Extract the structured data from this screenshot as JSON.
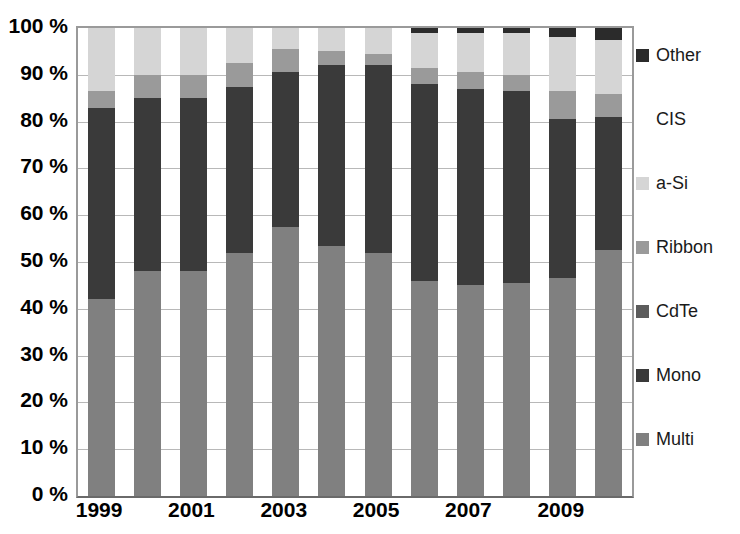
{
  "chart_data": {
    "type": "bar",
    "subtype": "stacked-percentage",
    "title": "",
    "subtitle": "",
    "xlabel": "",
    "ylabel": "",
    "ylim": [
      0,
      100
    ],
    "yunit": "%",
    "grid": true,
    "legend_position": "right",
    "categories": [
      "1999",
      "2000",
      "2001",
      "2002",
      "2003",
      "2004",
      "2005",
      "2006",
      "2007",
      "2008",
      "2009",
      "2010"
    ],
    "x_tick_labels": [
      "1999",
      "",
      "2001",
      "",
      "2003",
      "",
      "2005",
      "",
      "2007",
      "",
      "2009",
      ""
    ],
    "y_tick_labels": [
      "0 %",
      "10 %",
      "20 %",
      "30 %",
      "40 %",
      "50 %",
      "60 %",
      "70 %",
      "80 %",
      "90 %",
      "100 %"
    ],
    "y_tick_values": [
      0,
      10,
      20,
      30,
      40,
      50,
      60,
      70,
      80,
      90,
      100
    ],
    "series": [
      {
        "name": "Multi",
        "color": "#808080",
        "values": [
          42,
          48,
          48,
          52,
          57.5,
          53.5,
          52,
          46,
          45,
          45.5,
          46.5,
          52.5
        ]
      },
      {
        "name": "Mono",
        "color": "#3a3a3a",
        "values": [
          41,
          37,
          37,
          35.5,
          33,
          38.5,
          40,
          42,
          42,
          41,
          34,
          28.5
        ]
      },
      {
        "name": "CdTe",
        "color": "#5c5c5c",
        "values": [
          0,
          0,
          0,
          0,
          0,
          0,
          0,
          0,
          0,
          0,
          0,
          0
        ]
      },
      {
        "name": "Ribbon",
        "color": "#9a9a9a",
        "values": [
          3.5,
          5,
          5,
          5,
          5,
          3,
          2.5,
          3.5,
          3.5,
          3.5,
          6,
          5
        ]
      },
      {
        "name": "a-Si",
        "color": "#d5d5d5",
        "values": [
          13.5,
          10,
          10,
          7.5,
          4.5,
          5,
          5.5,
          7.5,
          8.5,
          9,
          11.5,
          11.5
        ]
      },
      {
        "name": "CIS",
        "color": "#ffffff",
        "values": [
          0,
          0,
          0,
          0,
          0,
          0,
          0,
          0,
          0,
          0,
          0,
          0
        ]
      },
      {
        "name": "Other",
        "color": "#2b2b2b",
        "values": [
          0,
          0,
          0,
          0,
          0,
          0,
          0,
          1,
          1,
          1,
          2,
          2.5
        ]
      }
    ]
  },
  "legend": {
    "items": [
      {
        "label": "Other",
        "color": "#2b2b2b",
        "swatch_visible": true
      },
      {
        "label": "CIS",
        "color": "#ffffff",
        "swatch_visible": false
      },
      {
        "label": "a-Si",
        "color": "#d5d5d5",
        "swatch_visible": true
      },
      {
        "label": "Ribbon",
        "color": "#9a9a9a",
        "swatch_visible": true
      },
      {
        "label": "CdTe",
        "color": "#5c5c5c",
        "swatch_visible": true
      },
      {
        "label": "Mono",
        "color": "#3a3a3a",
        "swatch_visible": true
      },
      {
        "label": "Multi",
        "color": "#808080",
        "swatch_visible": true
      }
    ]
  },
  "axes": {
    "gridline_color": "#b8b8b8",
    "frame_color": "#9a9a9a"
  }
}
